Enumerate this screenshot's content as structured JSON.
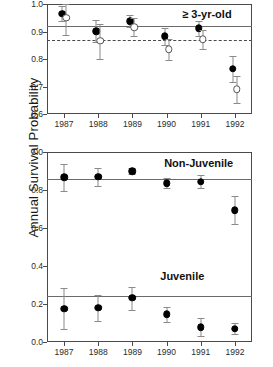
{
  "figure": {
    "ylabel_left": "Annual Survival Probability",
    "ylabel_right": "Annual Survival Probability"
  },
  "chart_data": [
    {
      "type": "scatter",
      "panel": "top",
      "title": "",
      "annotation": "≥ 3-yr-old",
      "xlabel": "",
      "ylabel": "Annual Survival Probability",
      "categories": [
        "1987",
        "1988",
        "1989",
        "1990",
        "1991",
        "1992"
      ],
      "x": [
        1987,
        1988,
        1989,
        1990,
        1991,
        1992
      ],
      "ylim": [
        0.6,
        1.0
      ],
      "yticks": [
        0.6,
        0.7,
        0.8,
        0.9,
        1.0
      ],
      "ytick_labels": [
        "0.6",
        "0.7",
        "0.8",
        "0.9",
        "1.0"
      ],
      "grid": false,
      "legend": "none",
      "series": [
        {
          "name": "filled-circle-series",
          "marker": "filled-circle",
          "values": [
            0.965,
            0.901,
            0.938,
            0.882,
            0.911,
            0.765
          ],
          "err_low": [
            0.938,
            0.861,
            0.915,
            0.852,
            0.884,
            0.718
          ],
          "err_high": [
            0.992,
            0.941,
            0.961,
            0.912,
            0.938,
            0.812
          ]
        },
        {
          "name": "open-circle-series",
          "marker": "open-circle",
          "values": [
            0.95,
            0.866,
            0.915,
            0.835,
            0.871,
            0.69
          ],
          "err_low": [
            0.889,
            0.801,
            0.882,
            0.798,
            0.836,
            0.641
          ],
          "err_high": [
            1.0,
            0.929,
            0.948,
            0.872,
            0.906,
            0.739
          ]
        }
      ],
      "reference_lines": [
        {
          "name": "solid-reference-line",
          "value": 0.92,
          "style": "solid"
        },
        {
          "name": "dashed-reference-line",
          "value": 0.87,
          "style": "dashed"
        }
      ]
    },
    {
      "type": "scatter",
      "panel": "bottom",
      "title": "",
      "xlabel": "",
      "ylabel": "Annual Survival Probability",
      "categories": [
        "1987",
        "1988",
        "1989",
        "1990",
        "1991",
        "1992"
      ],
      "x": [
        1987,
        1988,
        1989,
        1990,
        1991,
        1992
      ],
      "ylim": [
        0.0,
        1.0
      ],
      "yticks": [
        0.0,
        0.2,
        0.4,
        0.6,
        0.8,
        1.0
      ],
      "ytick_labels": [
        "0.0",
        "0.2",
        "0.4",
        "0.6",
        "0.8",
        "1.0"
      ],
      "grid": false,
      "legend": "inline-labels",
      "series": [
        {
          "name": "Non-Juvenile",
          "marker": "filled-circle",
          "values": [
            0.866,
            0.869,
            0.9,
            0.836,
            0.844,
            0.694
          ],
          "err_low": [
            0.795,
            0.82,
            0.884,
            0.81,
            0.812,
            0.62
          ],
          "err_high": [
            0.938,
            0.916,
            0.917,
            0.862,
            0.879,
            0.768
          ]
        },
        {
          "name": "Juvenile",
          "marker": "filled-circle",
          "values": [
            0.176,
            0.18,
            0.232,
            0.145,
            0.078,
            0.07
          ],
          "err_low": [
            0.068,
            0.111,
            0.17,
            0.104,
            0.031,
            0.042
          ],
          "err_high": [
            0.283,
            0.249,
            0.292,
            0.186,
            0.126,
            0.098
          ]
        }
      ],
      "reference_lines": [
        {
          "name": "non-juvenile-reference-line",
          "value": 0.86,
          "style": "solid"
        },
        {
          "name": "juvenile-reference-line",
          "value": 0.24,
          "style": "solid"
        }
      ],
      "annotations": [
        {
          "name": "non-juvenile-label",
          "text": "Non-Juvenile"
        },
        {
          "name": "juvenile-label",
          "text": "Juvenile"
        }
      ]
    }
  ]
}
